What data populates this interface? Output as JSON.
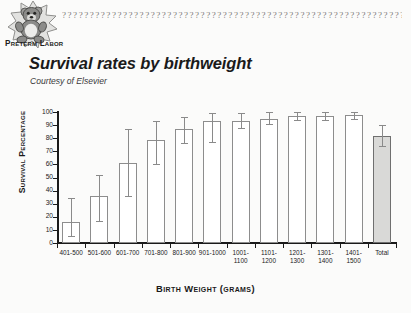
{
  "header": {
    "logo_caption": "Preterm Labor",
    "logo_icon": "teddy-bear-starburst-icon",
    "decorative_rule": "???????????????????????????????????????????????????????????????????"
  },
  "title": "Survival rates by birthweight",
  "subtitle": "Courtesy of Elsevier",
  "colors": {
    "axis": "#1a1a1a",
    "bar_outline": "#8d8d8d",
    "bar_fill": "#ffffff",
    "total_bar_fill": "#d9d9d7",
    "error_bar": "#8a8a8a",
    "page_background": "#fbfbfa"
  },
  "chart_data": {
    "type": "bar",
    "title": "Survival rates by birthweight",
    "subtitle": "Courtesy of Elsevier",
    "xlabel": "Birth Weight (grams)",
    "ylabel": "Survival Percentage",
    "ylim": [
      0,
      100
    ],
    "yticks": [
      0,
      10,
      20,
      30,
      40,
      50,
      60,
      70,
      80,
      90,
      100
    ],
    "grid": false,
    "legend": null,
    "categories": [
      "401-500",
      "501-600",
      "601-700",
      "701-800",
      "801-900",
      "901-1000",
      "1001-1100",
      "1101-1200",
      "1201-1300",
      "1301-1400",
      "1401-1500",
      "Total"
    ],
    "category_lines": [
      [
        "401-500"
      ],
      [
        "501-600"
      ],
      [
        "601-700"
      ],
      [
        "701-800"
      ],
      [
        "801-900"
      ],
      [
        "901-1000"
      ],
      [
        "1001-",
        "1100"
      ],
      [
        "1101-",
        "1200"
      ],
      [
        "1201-",
        "1300"
      ],
      [
        "1301-",
        "1400"
      ],
      [
        "1401-",
        "1500"
      ],
      [
        "Total"
      ]
    ],
    "values": [
      16,
      36,
      61,
      79,
      87,
      93,
      93,
      95,
      97,
      97,
      98,
      82
    ],
    "error_low": [
      5,
      17,
      36,
      60,
      76,
      77,
      88,
      91,
      94,
      94,
      95,
      74
    ],
    "error_high": [
      34,
      52,
      87,
      93,
      96,
      99,
      99,
      100,
      100,
      100,
      100,
      90
    ],
    "highlighted_category": "Total"
  }
}
